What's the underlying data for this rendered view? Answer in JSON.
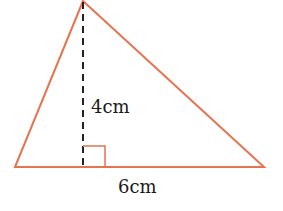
{
  "diagram": {
    "shape": "triangle",
    "colors": {
      "triangle": "#e8734f",
      "height_line": "#222222",
      "text": "#1a1a1a"
    },
    "labels": {
      "height": "4cm",
      "base": "6cm"
    },
    "vertices": {
      "apex": [
        83,
        1
      ],
      "base_left": [
        15,
        167
      ],
      "base_right": [
        264,
        167
      ]
    },
    "right_angle_marker": true
  }
}
